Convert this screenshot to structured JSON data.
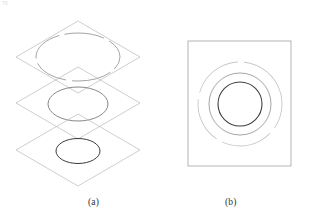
{
  "figure": {
    "background_color": "#ffffff",
    "width": 323,
    "height": 220,
    "corner_marks": {
      "top_left": "70",
      "top_right": ""
    },
    "panels": [
      {
        "id": "a",
        "caption": "(a)",
        "description": "three stacked isometric planes each containing an ellipse",
        "layers": [
          {
            "name": "top-plane",
            "plane": {
              "center_x": 78,
              "center_y": 57,
              "half_width": 62,
              "half_height": 36,
              "stroke": "#b9b9b9",
              "stroke_width": 0.7
            },
            "ellipse": {
              "center_x": 78,
              "center_y": 57,
              "radius_x": 42,
              "radius_y": 24,
              "stroke": "#9a9a9a",
              "stroke_width": 0.9,
              "style": "broken"
            }
          },
          {
            "name": "middle-plane",
            "plane": {
              "center_x": 78,
              "center_y": 103,
              "half_width": 62,
              "half_height": 36,
              "stroke": "#b9b9b9",
              "stroke_width": 0.7
            },
            "ellipse": {
              "center_x": 78,
              "center_y": 104,
              "radius_x": 30,
              "radius_y": 17,
              "stroke": "#7a7a7a",
              "stroke_width": 0.9,
              "style": "solid"
            }
          },
          {
            "name": "bottom-plane",
            "plane": {
              "center_x": 78,
              "center_y": 150,
              "half_width": 62,
              "half_height": 36,
              "stroke": "#b9b9b9",
              "stroke_width": 0.7
            },
            "ellipse": {
              "center_x": 78,
              "center_y": 151,
              "radius_x": 22,
              "radius_y": 12.5,
              "stroke": "#3a3a3a",
              "stroke_width": 1.0,
              "style": "solid"
            }
          }
        ]
      },
      {
        "id": "b",
        "caption": "(b)",
        "description": "square frame containing three concentric circles",
        "frame": {
          "x": 188,
          "y": 41,
          "width": 103,
          "height": 125,
          "stroke": "#a2a2a2",
          "stroke_width": 0.8
        },
        "circles": [
          {
            "name": "outer-circle",
            "center_x": 240,
            "center_y": 104,
            "radius": 42,
            "stroke": "#c9c9c9",
            "stroke_width": 0.9,
            "style": "broken"
          },
          {
            "name": "middle-circle",
            "center_x": 240,
            "center_y": 104,
            "radius": 31,
            "stroke": "#9c9c9c",
            "stroke_width": 0.9,
            "style": "solid"
          },
          {
            "name": "inner-circle",
            "center_x": 240,
            "center_y": 104,
            "radius": 22,
            "stroke": "#3f3f3f",
            "stroke_width": 1.1,
            "style": "solid"
          }
        ]
      }
    ]
  }
}
